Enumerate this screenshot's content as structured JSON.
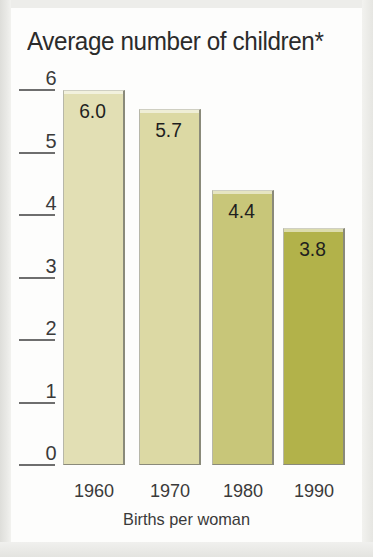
{
  "chart_data": {
    "type": "bar",
    "title": "Average number of children*",
    "xlabel": "Births per woman",
    "ylabel": "",
    "categories": [
      "1960",
      "1970",
      "1980",
      "1990"
    ],
    "values": [
      6.0,
      5.7,
      4.4,
      3.8
    ],
    "value_labels": [
      "6.0",
      "5.7",
      "4.4",
      "3.8"
    ],
    "ylim": [
      0,
      6
    ],
    "y_ticks": [
      "6",
      "5",
      "4",
      "3",
      "2",
      "1",
      "0"
    ],
    "y_tick_values": [
      6,
      5,
      4,
      3,
      2,
      1,
      0
    ],
    "grid": false,
    "legend": null,
    "bar_colors": [
      "#e2dfb4",
      "#dcd9a4",
      "#c8c679",
      "#b2b24a"
    ],
    "bar_border_color": "#8a8a7a",
    "text_color": "#2b2b2b",
    "background_color": "#fdfdfc"
  },
  "figure": {
    "page_background": "#e9e9e6"
  }
}
